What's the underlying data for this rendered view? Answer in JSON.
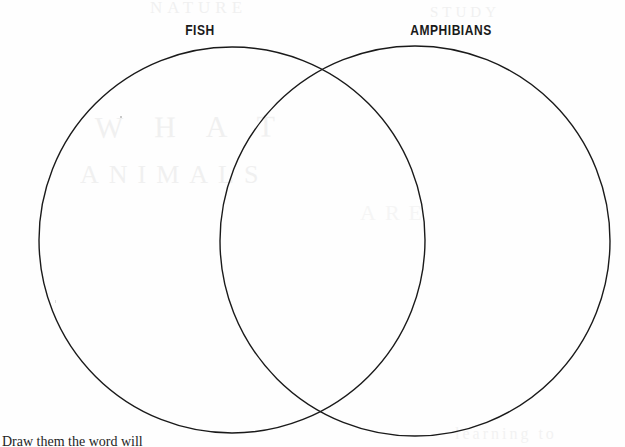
{
  "page": {
    "background_color": "#fefefe",
    "width": 625,
    "height": 447
  },
  "diagram": {
    "type": "venn-diagram",
    "stroke_color": "#1a1a1a",
    "stroke_width": 1.4,
    "fill": "none",
    "left_circle": {
      "label": "FISH",
      "center_x": 232,
      "center_y": 240,
      "radius": 193
    },
    "right_circle": {
      "label": "AMPHIBIANS",
      "center_x": 415,
      "center_y": 241,
      "radius": 195
    },
    "regions": {
      "left_only": "",
      "overlap": "",
      "right_only": ""
    }
  },
  "labels": {
    "left": "FISH",
    "right": "AMPHIBIANS"
  },
  "instruction": {
    "text": "Draw them the word will"
  },
  "artifacts": {
    "ghost_top_left": "NATURE",
    "ghost_top_right": "STUDY",
    "ghost_mid_1": "W H A T",
    "ghost_mid_2": "ANIMALS",
    "ghost_bottom_right": "learning to",
    "ghost_center": "ARE"
  }
}
